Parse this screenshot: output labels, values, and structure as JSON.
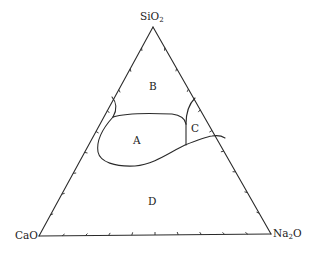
{
  "diagram": {
    "type": "ternary-phase-diagram",
    "vertices": {
      "top": {
        "formula": "SiO",
        "subscript": "2"
      },
      "bottom_left": {
        "formula": "CaO",
        "subscript": ""
      },
      "bottom_right": {
        "formula": "Na",
        "subscript": "2",
        "suffix": "O"
      }
    },
    "regions": [
      {
        "id": "A",
        "label": "A"
      },
      {
        "id": "B",
        "label": "B"
      },
      {
        "id": "C",
        "label": "C"
      },
      {
        "id": "D",
        "label": "D"
      }
    ],
    "tick_divisions_per_side": 10,
    "line_color": "#2a2a2a",
    "background_color": "#ffffff"
  }
}
